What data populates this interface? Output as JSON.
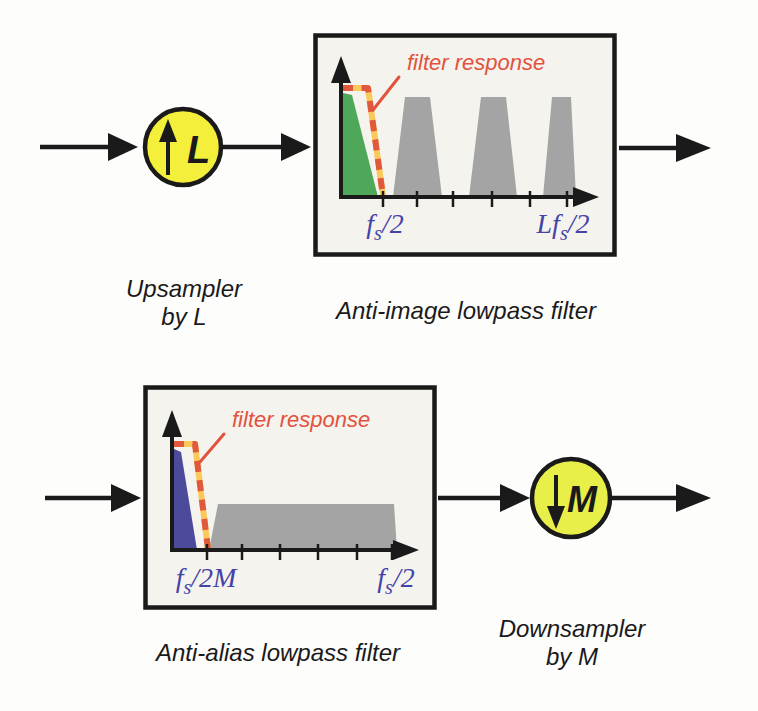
{
  "colors": {
    "ink": "#1a1a1a",
    "box_fill": "#f5f3ee",
    "upsampler_fill": "#f3ef3b",
    "downsampler_fill": "#e9ef49",
    "spectrum_green": "#4fa85a",
    "spectrum_blue": "#4b4a9b",
    "spectrum_gray": "#a4a4a4",
    "dash_yellow": "#fbc95a",
    "dash_orange": "#e0593c",
    "annotation_red": "#e2523d",
    "axis_label_blue": "#4543a8"
  },
  "top_row": {
    "upsampler": {
      "symbol": "up-arrow",
      "factor_label": "L"
    },
    "upsampler_caption": {
      "line1": "Upsampler",
      "line2": "by L"
    },
    "filter_caption": "Anti-image lowpass filter",
    "filter_box": {
      "annotation": "filter response",
      "x_label_passband": {
        "main": "f",
        "sub": "s",
        "rest": "/2"
      },
      "x_label_end": {
        "main": "Lf",
        "sub": "s",
        "rest": "/2"
      }
    }
  },
  "bottom_row": {
    "downsampler": {
      "symbol": "down-arrow",
      "factor_label": "M"
    },
    "downsampler_caption": {
      "line1": "Downsampler",
      "line2": "by M"
    },
    "filter_caption": "Anti-alias lowpass filter",
    "filter_box": {
      "annotation": "filter response",
      "x_label_passband": {
        "main": "f",
        "sub": "s",
        "rest": "/2M"
      },
      "x_label_end": {
        "main": "f",
        "sub": "s",
        "rest": "/2"
      }
    }
  }
}
